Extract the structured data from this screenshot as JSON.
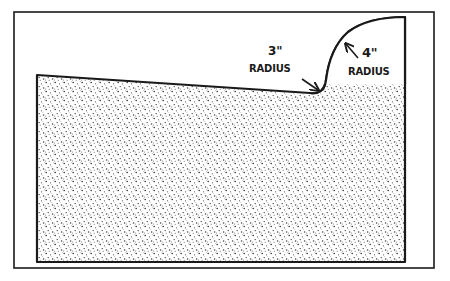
{
  "diagram": {
    "colors": {
      "stroke": "#1a1a1a",
      "background": "#ffffff",
      "stipple": "#333333"
    },
    "annotations": [
      {
        "id": "radius-3",
        "value": "3\"",
        "label": "RADIUS"
      },
      {
        "id": "radius-4",
        "value": "4\"",
        "label": "RADIUS"
      }
    ]
  }
}
